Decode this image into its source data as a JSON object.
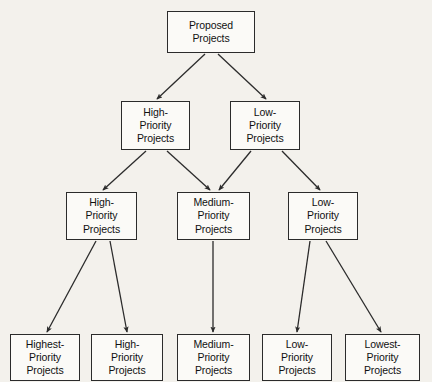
{
  "diagram": {
    "type": "tree-flowchart",
    "background_color": "#f3f1ec",
    "box_fill_color": "#fbfaf7",
    "box_border_color": "#2b2b2b",
    "connector_color": "#2b2b2b",
    "levels": [
      {
        "level": 1,
        "nodes": [
          {
            "id": "proposed",
            "lines": [
              "Proposed",
              "Projects"
            ],
            "x": 167,
            "y": 11,
            "w": 88,
            "h": 42
          }
        ]
      },
      {
        "level": 2,
        "nodes": [
          {
            "id": "l2-high",
            "lines": [
              "High-",
              "Priority",
              "Projects"
            ],
            "x": 121,
            "y": 101,
            "w": 69,
            "h": 49
          },
          {
            "id": "l2-low",
            "lines": [
              "Low-",
              "Priority",
              "Projects"
            ],
            "x": 230,
            "y": 101,
            "w": 70,
            "h": 49
          }
        ]
      },
      {
        "level": 3,
        "nodes": [
          {
            "id": "l3-high",
            "lines": [
              "High-",
              "Priority",
              "Projects"
            ],
            "x": 66,
            "y": 192,
            "w": 71,
            "h": 48
          },
          {
            "id": "l3-medium",
            "lines": [
              "Medium-",
              "Priority",
              "Projects"
            ],
            "x": 177,
            "y": 192,
            "w": 73,
            "h": 48
          },
          {
            "id": "l3-low",
            "lines": [
              "Low-",
              "Priority",
              "Projects"
            ],
            "x": 288,
            "y": 192,
            "w": 70,
            "h": 48
          }
        ]
      },
      {
        "level": 4,
        "nodes": [
          {
            "id": "l4-highest",
            "lines": [
              "Highest-",
              "Priority",
              "Projects"
            ],
            "x": 10,
            "y": 334,
            "w": 70,
            "h": 47
          },
          {
            "id": "l4-high",
            "lines": [
              "High-",
              "Priority",
              "Projects"
            ],
            "x": 91,
            "y": 334,
            "w": 72,
            "h": 47
          },
          {
            "id": "l4-medium",
            "lines": [
              "Medium-",
              "Priority",
              "Projects"
            ],
            "x": 177,
            "y": 334,
            "w": 73,
            "h": 47
          },
          {
            "id": "l4-low",
            "lines": [
              "Low-",
              "Priority",
              "Projects"
            ],
            "x": 262,
            "y": 334,
            "w": 70,
            "h": 47
          },
          {
            "id": "l4-lowest",
            "lines": [
              "Lowest-",
              "Priority",
              "Projects"
            ],
            "x": 345,
            "y": 334,
            "w": 75,
            "h": 47
          }
        ]
      }
    ],
    "edges": [
      {
        "from": "proposed",
        "to": "l2-high",
        "x1": 205,
        "y1": 54,
        "x2": 157,
        "y2": 99
      },
      {
        "from": "proposed",
        "to": "l2-low",
        "x1": 218,
        "y1": 54,
        "x2": 266,
        "y2": 99
      },
      {
        "from": "l2-high",
        "to": "l3-high",
        "x1": 146,
        "y1": 151,
        "x2": 103,
        "y2": 190
      },
      {
        "from": "l2-high",
        "to": "l3-medium",
        "x1": 167,
        "y1": 151,
        "x2": 210,
        "y2": 190
      },
      {
        "from": "l2-low",
        "to": "l3-medium",
        "x1": 251,
        "y1": 151,
        "x2": 219,
        "y2": 190
      },
      {
        "from": "l2-low",
        "to": "l3-low",
        "x1": 282,
        "y1": 151,
        "x2": 320,
        "y2": 190
      },
      {
        "from": "l3-high",
        "to": "l4-highest",
        "x1": 96,
        "y1": 241,
        "x2": 47,
        "y2": 332
      },
      {
        "from": "l3-high",
        "to": "l4-high",
        "x1": 110,
        "y1": 241,
        "x2": 127,
        "y2": 332
      },
      {
        "from": "l3-medium",
        "to": "l4-medium",
        "x1": 213,
        "y1": 241,
        "x2": 213,
        "y2": 332
      },
      {
        "from": "l3-low",
        "to": "l4-low",
        "x1": 310,
        "y1": 241,
        "x2": 297,
        "y2": 332
      },
      {
        "from": "l3-low",
        "to": "l4-lowest",
        "x1": 326,
        "y1": 241,
        "x2": 381,
        "y2": 332
      }
    ]
  }
}
